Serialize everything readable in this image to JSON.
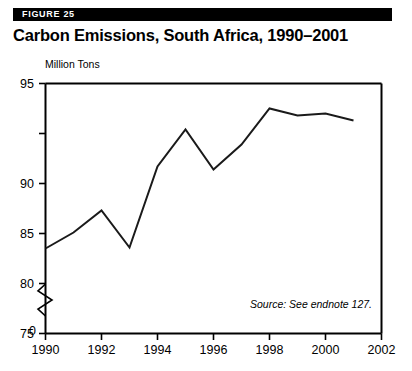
{
  "header": {
    "figure_label": "FIGURE 25",
    "title": "Carbon Emissions, South Africa, 1990–2001",
    "bar_color": "#000000",
    "label_color": "#ffffff"
  },
  "chart_data": {
    "type": "line",
    "title": "Carbon Emissions, South Africa, 1990–2001",
    "xlabel": "",
    "ylabel": "Million Tons",
    "unit_label": "Million Tons",
    "x": [
      1990,
      1991,
      1992,
      1993,
      1994,
      1995,
      1996,
      1997,
      1998,
      1999,
      2000,
      2001
    ],
    "values": [
      78.5,
      80.1,
      82.3,
      78.6,
      86.7,
      90.4,
      86.4,
      88.9,
      92.5,
      91.8,
      92.0,
      91.3
    ],
    "series": [
      {
        "name": "Carbon Emissions",
        "values": [
          78.5,
          80.1,
          82.3,
          78.6,
          86.7,
          90.4,
          86.4,
          88.9,
          92.5,
          91.8,
          92.0,
          91.3
        ]
      }
    ],
    "xlim": [
      1990,
      2002
    ],
    "ylim": [
      75,
      95
    ],
    "y_axis_break": true,
    "y_break_from": 0,
    "y_break_to": 75,
    "y_ticks": [
      "0",
      "75",
      "80",
      "85",
      "90",
      "95"
    ],
    "y_tick_values": [
      0,
      75,
      80,
      85,
      90,
      95
    ],
    "x_ticks": [
      "1990",
      "1992",
      "1994",
      "1996",
      "1998",
      "2000",
      "2002"
    ],
    "x_tick_values": [
      1990,
      1992,
      1994,
      1996,
      1998,
      2000,
      2002
    ],
    "grid": false,
    "legend": "none",
    "line_color": "#1a1a1a",
    "frame_color": "#000000",
    "annotations": [
      {
        "text": "Source: See endnote 127.",
        "style": "italic",
        "position": "bottom-right"
      }
    ]
  },
  "source_note": "Source: See endnote 127."
}
